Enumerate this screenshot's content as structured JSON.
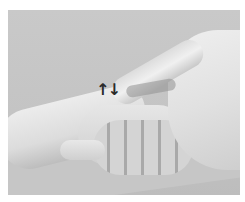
{
  "image": {
    "description": "Grayscale photo of one hand pressing a finger on the back of another person's wrist/hand, with an up-down arrow annotation",
    "annotation": {
      "up_arrow": "↑",
      "down_arrow": "↓"
    },
    "colors": {
      "background": "#c6c6c6",
      "arrow": "#2a2a2a",
      "border": "#ffffff"
    }
  }
}
